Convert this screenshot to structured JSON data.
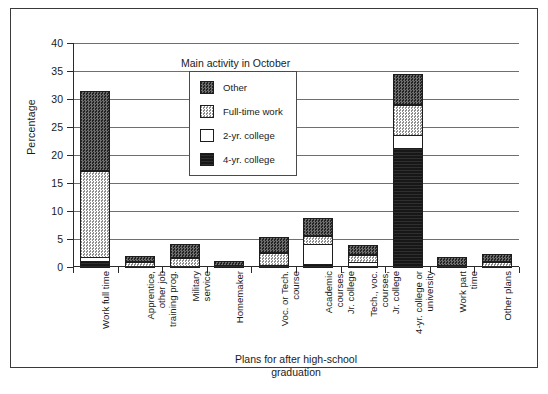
{
  "figure": {
    "caption": ""
  },
  "axes": {
    "ylabel": "Percentage",
    "xlabel": "Plans for after high-school\ngraduation",
    "yticks": [
      "0",
      "5",
      "10",
      "15",
      "20",
      "25",
      "30",
      "35",
      "40"
    ]
  },
  "legend": {
    "title": "Main activity in October",
    "items": [
      {
        "label": "Other",
        "key": "other",
        "color": "#3f3f3f"
      },
      {
        "label": "Full-time work",
        "key": "fulltime",
        "color": "#d2d2d2"
      },
      {
        "label": "2-yr. college",
        "key": "twoyr",
        "color": "#ffffff"
      },
      {
        "label": "4-yr. college",
        "key": "fouryr",
        "color": "#171717"
      }
    ]
  },
  "chart_data": {
    "type": "bar",
    "subtype": "stacked",
    "title": "",
    "xlabel": "Plans for after high-school graduation",
    "ylabel": "Percentage",
    "ylim": [
      0,
      40
    ],
    "ytick_step": 5,
    "grid": true,
    "legend_title": "Main activity in October",
    "legend_position": "upper-center-inside",
    "categories": [
      "Work full time",
      "Apprentice, other job training prog.",
      "Military service",
      "Homemaker",
      "Voc. or Tech. course",
      "Academic courses, Jr. college",
      "Tech., voc. courses, Jr. college",
      "4-yr. college or university",
      "Work part time",
      "Other plans"
    ],
    "category_lines": [
      [
        "Work full time"
      ],
      [
        "Apprentice,",
        "other job",
        "training prog."
      ],
      [
        "Military",
        "service"
      ],
      [
        "Homemaker"
      ],
      [
        "Voc. or Tech.",
        "course"
      ],
      [
        "Academic",
        "courses,",
        "Jr. college"
      ],
      [
        "Tech., voc.",
        "courses,",
        "Jr. college"
      ],
      [
        "4-yr. college or",
        "university"
      ],
      [
        "Work part",
        "time"
      ],
      [
        "Other plans"
      ]
    ],
    "series": [
      {
        "name": "4-yr. college",
        "values": [
          1.3,
          0.0,
          0.0,
          0.0,
          0.2,
          0.8,
          0.3,
          21.5,
          0.0,
          0.0
        ]
      },
      {
        "name": "2-yr. college",
        "values": [
          0.9,
          0.1,
          0.1,
          0.0,
          0.2,
          3.7,
          0.9,
          2.5,
          0.0,
          0.1
        ]
      },
      {
        "name": "Full-time work",
        "values": [
          15.4,
          0.8,
          1.5,
          0.1,
          2.3,
          1.6,
          1.4,
          5.5,
          0.1,
          0.9
        ]
      },
      {
        "name": "Other",
        "values": [
          14.4,
          1.1,
          2.6,
          0.8,
          2.8,
          3.2,
          1.7,
          5.5,
          1.6,
          1.4
        ]
      }
    ],
    "totals": [
      32.0,
      2.0,
      4.2,
      0.9,
      5.5,
      9.3,
      4.3,
      35.0,
      1.7,
      2.4
    ]
  }
}
